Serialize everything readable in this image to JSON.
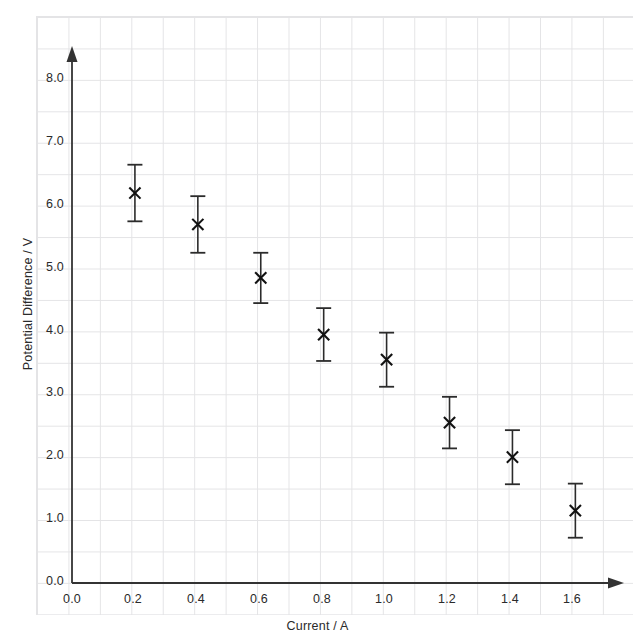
{
  "chart_data": {
    "type": "scatter",
    "title": "",
    "xlabel": "Current / A",
    "ylabel": "Potential Difference / V",
    "xlim": [
      0.0,
      1.8
    ],
    "ylim": [
      0.0,
      8.5
    ],
    "grid": true,
    "grid_style": "graph-paper",
    "legend": "none",
    "errorbars": true,
    "marker": "x",
    "x": [
      0.2,
      0.4,
      0.6,
      0.8,
      1.0,
      1.2,
      1.4,
      1.6
    ],
    "y": [
      6.2,
      5.7,
      4.85,
      3.95,
      3.55,
      2.55,
      2.0,
      1.15
    ],
    "yerr": [
      0.45,
      0.45,
      0.4,
      0.42,
      0.43,
      0.41,
      0.43,
      0.43
    ],
    "points": [
      {
        "x": 0.2,
        "y": 6.2,
        "yerr": 0.45,
        "ylow": 5.75,
        "yhigh": 6.65
      },
      {
        "x": 0.4,
        "y": 5.7,
        "yerr": 0.45,
        "ylow": 5.25,
        "yhigh": 6.15
      },
      {
        "x": 0.6,
        "y": 4.85,
        "yerr": 0.4,
        "ylow": 4.45,
        "yhigh": 5.25
      },
      {
        "x": 0.8,
        "y": 3.95,
        "yerr": 0.42,
        "ylow": 3.53,
        "yhigh": 4.37
      },
      {
        "x": 1.0,
        "y": 3.55,
        "yerr": 0.43,
        "ylow": 3.12,
        "yhigh": 3.98
      },
      {
        "x": 1.2,
        "y": 2.55,
        "yerr": 0.41,
        "ylow": 2.14,
        "yhigh": 2.96
      },
      {
        "x": 1.4,
        "y": 2.0,
        "yerr": 0.43,
        "ylow": 1.57,
        "yhigh": 2.43
      },
      {
        "x": 1.6,
        "y": 1.15,
        "yerr": 0.43,
        "ylow": 0.72,
        "yhigh": 1.58
      }
    ],
    "xticks": [
      0.0,
      0.2,
      0.4,
      0.6,
      0.8,
      1.0,
      1.2,
      1.4,
      1.6
    ],
    "xticklabels": [
      "0.0",
      "0.2",
      "0.4",
      "0.6",
      "0.8",
      "1.0",
      "1.2",
      "1.4",
      "1.6"
    ],
    "yticks": [
      0.0,
      1.0,
      2.0,
      3.0,
      4.0,
      5.0,
      6.0,
      7.0,
      8.0
    ],
    "yticklabels": [
      "0.0",
      "1.0",
      "2.0",
      "3.0",
      "4.0",
      "5.0",
      "6.0",
      "7.0",
      "8.0"
    ],
    "colors": {
      "marker": "#111111",
      "errorbar": "#2b2b2b",
      "axis": "#333333",
      "grid": "#e4e4e6",
      "background": "#ffffff",
      "text": "#2a2a2a"
    }
  }
}
